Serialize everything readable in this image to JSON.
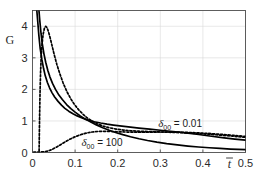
{
  "chart_data": {
    "type": "line",
    "title": "",
    "xlabel": "t̄",
    "ylabel": "G",
    "xlim": [
      0,
      0.5
    ],
    "ylim": [
      0,
      4.5
    ],
    "xticks": [
      "0",
      "0.1",
      "0.2",
      "0.3",
      "0.4",
      "0.5"
    ],
    "xtick_values": [
      0,
      0.1,
      0.2,
      0.3,
      0.4,
      0.5
    ],
    "yticks": [
      "0",
      "1",
      "2",
      "3",
      "4"
    ],
    "ytick_values": [
      0,
      1,
      2,
      3,
      4
    ],
    "grid": true,
    "legend_position": "inline-annotations",
    "annotations": [
      {
        "id": "annot-delta-001",
        "symbol": "δ",
        "subscript": "00",
        "equals": " = ",
        "value": "0.01",
        "text": "δ₀₀ = 0.01",
        "x": 0.295,
        "y": 0.8
      },
      {
        "id": "annot-delta-100",
        "symbol": "δ",
        "subscript": "00",
        "equals": " = ",
        "value": "100",
        "text": "δ₀₀ = 100",
        "x": 0.115,
        "y": 0.2
      }
    ],
    "series": [
      {
        "name": "solid-upper",
        "style": "solid",
        "color": "#000000",
        "points": [
          [
            0.0095,
            4.6
          ],
          [
            0.012,
            4.2
          ],
          [
            0.015,
            3.7
          ],
          [
            0.018,
            3.3
          ],
          [
            0.022,
            2.95
          ],
          [
            0.026,
            2.66
          ],
          [
            0.03,
            2.43
          ],
          [
            0.035,
            2.22
          ],
          [
            0.04,
            2.05
          ],
          [
            0.046,
            1.89
          ],
          [
            0.052,
            1.76
          ],
          [
            0.06,
            1.62
          ],
          [
            0.068,
            1.5
          ],
          [
            0.076,
            1.4
          ],
          [
            0.085,
            1.31
          ],
          [
            0.095,
            1.23
          ],
          [
            0.105,
            1.16
          ],
          [
            0.115,
            1.1
          ],
          [
            0.125,
            1.05
          ],
          [
            0.135,
            1.01
          ],
          [
            0.145,
            0.975
          ],
          [
            0.16,
            0.935
          ],
          [
            0.175,
            0.9
          ],
          [
            0.19,
            0.87
          ],
          [
            0.21,
            0.835
          ],
          [
            0.23,
            0.805
          ],
          [
            0.25,
            0.775
          ],
          [
            0.275,
            0.74
          ],
          [
            0.3,
            0.705
          ],
          [
            0.33,
            0.665
          ],
          [
            0.36,
            0.62
          ],
          [
            0.39,
            0.57
          ],
          [
            0.42,
            0.515
          ],
          [
            0.45,
            0.465
          ],
          [
            0.475,
            0.425
          ],
          [
            0.5,
            0.39
          ]
        ]
      },
      {
        "name": "solid-lower",
        "style": "solid",
        "color": "#000000",
        "points": [
          [
            0.0145,
            4.6
          ],
          [
            0.017,
            4.2
          ],
          [
            0.02,
            3.78
          ],
          [
            0.023,
            3.44
          ],
          [
            0.027,
            3.12
          ],
          [
            0.031,
            2.86
          ],
          [
            0.036,
            2.6
          ],
          [
            0.041,
            2.39
          ],
          [
            0.047,
            2.19
          ],
          [
            0.054,
            2.0
          ],
          [
            0.062,
            1.82
          ],
          [
            0.07,
            1.68
          ],
          [
            0.08,
            1.52
          ],
          [
            0.09,
            1.39
          ],
          [
            0.1,
            1.28
          ],
          [
            0.112,
            1.16
          ],
          [
            0.125,
            1.05
          ],
          [
            0.138,
            0.955
          ],
          [
            0.15,
            0.875
          ],
          [
            0.165,
            0.785
          ],
          [
            0.18,
            0.705
          ],
          [
            0.195,
            0.635
          ],
          [
            0.212,
            0.565
          ],
          [
            0.23,
            0.5
          ],
          [
            0.25,
            0.435
          ],
          [
            0.27,
            0.38
          ],
          [
            0.292,
            0.328
          ],
          [
            0.315,
            0.282
          ],
          [
            0.34,
            0.24
          ],
          [
            0.365,
            0.205
          ],
          [
            0.39,
            0.175
          ],
          [
            0.415,
            0.15
          ],
          [
            0.44,
            0.128
          ],
          [
            0.465,
            0.11
          ],
          [
            0.5,
            0.09
          ]
        ]
      },
      {
        "name": "dotted-peaked",
        "style": "dotted",
        "color": "#000000",
        "points": [
          [
            0.0155,
            0.05
          ],
          [
            0.016,
            0.55
          ],
          [
            0.0168,
            1.25
          ],
          [
            0.0178,
            1.95
          ],
          [
            0.019,
            2.55
          ],
          [
            0.0205,
            3.05
          ],
          [
            0.0225,
            3.45
          ],
          [
            0.025,
            3.75
          ],
          [
            0.028,
            3.94
          ],
          [
            0.031,
            4.0
          ],
          [
            0.034,
            3.96
          ],
          [
            0.0375,
            3.83
          ],
          [
            0.0415,
            3.63
          ],
          [
            0.046,
            3.38
          ],
          [
            0.051,
            3.1
          ],
          [
            0.057,
            2.8
          ],
          [
            0.064,
            2.5
          ],
          [
            0.072,
            2.2
          ],
          [
            0.08,
            1.95
          ],
          [
            0.089,
            1.72
          ],
          [
            0.098,
            1.53
          ],
          [
            0.108,
            1.36
          ],
          [
            0.118,
            1.22
          ],
          [
            0.128,
            1.1
          ],
          [
            0.14,
            0.995
          ],
          [
            0.152,
            0.91
          ],
          [
            0.166,
            0.838
          ],
          [
            0.18,
            0.785
          ],
          [
            0.196,
            0.742
          ],
          [
            0.212,
            0.712
          ],
          [
            0.23,
            0.69
          ],
          [
            0.25,
            0.675
          ],
          [
            0.272,
            0.663
          ],
          [
            0.295,
            0.653
          ],
          [
            0.32,
            0.643
          ],
          [
            0.35,
            0.628
          ],
          [
            0.38,
            0.608
          ],
          [
            0.41,
            0.582
          ],
          [
            0.44,
            0.552
          ],
          [
            0.47,
            0.518
          ],
          [
            0.5,
            0.482
          ]
        ]
      },
      {
        "name": "dotted-rising",
        "style": "dotted",
        "color": "#000000",
        "points": [
          [
            0.003,
            0.01
          ],
          [
            0.012,
            0.012
          ],
          [
            0.02,
            0.016
          ],
          [
            0.028,
            0.026
          ],
          [
            0.035,
            0.045
          ],
          [
            0.042,
            0.075
          ],
          [
            0.049,
            0.118
          ],
          [
            0.056,
            0.17
          ],
          [
            0.064,
            0.232
          ],
          [
            0.072,
            0.298
          ],
          [
            0.08,
            0.362
          ],
          [
            0.089,
            0.428
          ],
          [
            0.098,
            0.487
          ],
          [
            0.108,
            0.541
          ],
          [
            0.118,
            0.585
          ],
          [
            0.128,
            0.62
          ],
          [
            0.14,
            0.65
          ],
          [
            0.152,
            0.665
          ],
          [
            0.164,
            0.672
          ],
          [
            0.176,
            0.67
          ],
          [
            0.19,
            0.663
          ],
          [
            0.205,
            0.655
          ],
          [
            0.222,
            0.648
          ],
          [
            0.24,
            0.645
          ],
          [
            0.26,
            0.645
          ],
          [
            0.282,
            0.648
          ],
          [
            0.305,
            0.65
          ],
          [
            0.33,
            0.648
          ],
          [
            0.358,
            0.64
          ],
          [
            0.385,
            0.625
          ],
          [
            0.412,
            0.605
          ],
          [
            0.44,
            0.578
          ],
          [
            0.47,
            0.545
          ],
          [
            0.5,
            0.508
          ]
        ]
      }
    ]
  },
  "figure": {
    "background": "#ffffff",
    "axis_color": "#4d4d4d",
    "grid_color": "#d9d9d9",
    "line_color": "#000000"
  }
}
